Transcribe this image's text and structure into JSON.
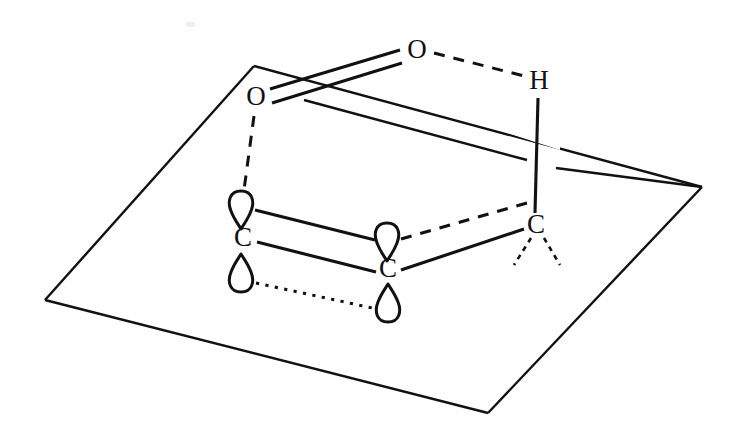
{
  "figure": {
    "background_color": "#fefefe",
    "ink_color": "#111111"
  },
  "atoms": [
    {
      "id": "O_top",
      "label": "O",
      "x": 417,
      "y": 52,
      "name": "atom-oxygen-top"
    },
    {
      "id": "O_left",
      "label": "O",
      "x": 256,
      "y": 99,
      "name": "atom-oxygen-left"
    },
    {
      "id": "H_right",
      "label": "H",
      "x": 539,
      "y": 83,
      "name": "atom-hydrogen-right"
    },
    {
      "id": "C_left",
      "label": "C",
      "x": 243,
      "y": 240,
      "name": "atom-carbon-left"
    },
    {
      "id": "C_center",
      "label": "C",
      "x": 388,
      "y": 271,
      "name": "atom-carbon-center"
    },
    {
      "id": "C_right",
      "label": "C",
      "x": 536,
      "y": 227,
      "name": "atom-carbon-right"
    }
  ],
  "orbital_lobes": [
    {
      "id": "lobe_Cleft_up",
      "cx": 241,
      "cy": 206,
      "direction": "point-down",
      "name": "orbital-lobe-carbon-left-upper"
    },
    {
      "id": "lobe_Cleft_down",
      "cx": 241,
      "cy": 278,
      "direction": "point-up",
      "name": "orbital-lobe-carbon-left-lower"
    },
    {
      "id": "lobe_Ccenter_up",
      "cx": 387,
      "cy": 238,
      "direction": "point-down",
      "name": "orbital-lobe-carbon-center-upper"
    },
    {
      "id": "lobe_Ccenter_down",
      "cx": 388,
      "cy": 307,
      "direction": "point-up",
      "name": "orbital-lobe-carbon-center-lower"
    }
  ],
  "bonds": [
    {
      "id": "b_O_O_double",
      "style": "double-solid",
      "from": "O_left",
      "to": "O_top",
      "name": "bond-oxygen-left-oxygen-top-double"
    },
    {
      "id": "b_O_H",
      "style": "dashed",
      "from": "O_top",
      "to": "H_right",
      "name": "hydrogen-bond-oxygen-top-hydrogen"
    },
    {
      "id": "b_H_C",
      "style": "solid",
      "from": "H_right",
      "to": "C_right",
      "name": "bond-hydrogen-carbon-right"
    },
    {
      "id": "b_O_lobe",
      "style": "dashed",
      "from": "O_left",
      "to": "lobe_Cleft_up",
      "name": "overlap-oxygen-left-carbon-left-orbital"
    },
    {
      "id": "b_lobe_upper",
      "style": "solid",
      "from": "lobe_Cleft_up",
      "to": "lobe_Ccenter_up",
      "name": "overlap-upper-lobes"
    },
    {
      "id": "b_C_C",
      "style": "solid",
      "from": "C_left",
      "to": "C_center",
      "name": "bond-carbon-left-carbon-center"
    },
    {
      "id": "b_lobe_lower",
      "style": "dotted",
      "from": "lobe_Cleft_down",
      "to": "lobe_Ccenter_down",
      "name": "overlap-lower-lobes"
    },
    {
      "id": "b_Cc_Cr",
      "style": "solid",
      "from": "C_center",
      "to": "C_right",
      "name": "bond-carbon-center-carbon-right"
    },
    {
      "id": "b_lobe_Cr",
      "style": "dashed",
      "from": "lobe_Ccenter_up",
      "to": "C_right",
      "name": "overlap-carbon-center-orbital-carbon-right"
    },
    {
      "id": "b_wedge_l",
      "style": "wedge-dashed",
      "from": "C_right",
      "to": "substituent-left",
      "name": "bond-carbon-right-substituent-left"
    },
    {
      "id": "b_wedge_r",
      "style": "wedge-dashed",
      "from": "C_right",
      "to": "substituent-right",
      "name": "bond-carbon-right-substituent-right"
    }
  ],
  "plane": {
    "name": "molecular-plane",
    "vertices": [
      {
        "x": 254,
        "y": 66
      },
      {
        "x": 702,
        "y": 187
      },
      {
        "x": 488,
        "y": 413
      },
      {
        "x": 45,
        "y": 300
      }
    ]
  }
}
